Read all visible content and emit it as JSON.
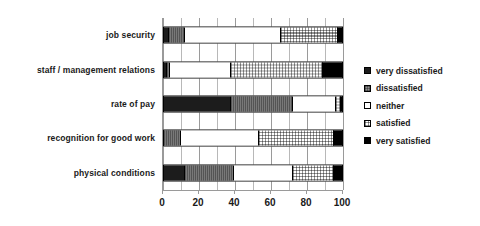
{
  "chart_data": {
    "type": "bar",
    "orientation": "horizontal",
    "stacked": true,
    "stack_mode": "percent",
    "title": "",
    "xlabel": "",
    "ylabel": "",
    "xlim": [
      0,
      100
    ],
    "xticks": [
      0,
      20,
      40,
      60,
      80,
      100
    ],
    "xtick_labels": [
      "0",
      "20",
      "40",
      "60",
      "80",
      "100"
    ],
    "minor_gridlines_every": 10,
    "grid": true,
    "legend_position": "right",
    "categories": [
      "job security",
      "staff / management relations",
      "rate of pay",
      "recognition for good work",
      "physical conditions"
    ],
    "series": [
      {
        "name": "very dissatisfied",
        "swatch": "very-dissatisfied",
        "color": "#1c1c1c",
        "values": [
          2,
          1,
          37,
          0,
          11
        ]
      },
      {
        "name": "dissatisfied",
        "swatch": "dissatisfied",
        "color": "#8e8e8e",
        "values": [
          9,
          2,
          35,
          9,
          28
        ]
      },
      {
        "name": "neither",
        "swatch": "neither",
        "color": "#ffffff",
        "values": [
          54,
          34,
          24,
          44,
          33
        ]
      },
      {
        "name": "satisfied",
        "swatch": "satisfied",
        "color": "#e8e8e8",
        "values": [
          32,
          52,
          3,
          42,
          23
        ]
      },
      {
        "name": "very satisfied",
        "swatch": "very-satisfied",
        "color": "#000000",
        "values": [
          3,
          11,
          1,
          5,
          5
        ]
      }
    ],
    "legend_entries": [
      "very dissatisfied",
      "dissatisfied",
      "neither",
      "satisfied",
      "very satisfied"
    ]
  }
}
